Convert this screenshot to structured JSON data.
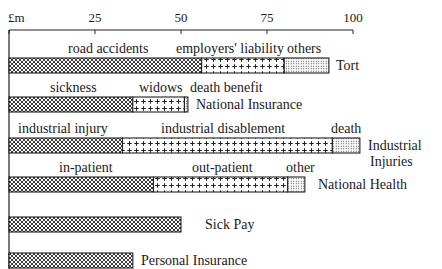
{
  "chart_data": {
    "type": "bar",
    "orientation": "horizontal",
    "stacked": true,
    "title": "",
    "xlabel": "£m",
    "ylabel": "",
    "xlim": [
      0,
      100
    ],
    "xticks": [
      0,
      25,
      50,
      75,
      100
    ],
    "xtick_labels": [
      "£m",
      "25",
      "50",
      "75",
      "100"
    ],
    "grid": false,
    "legend": "inline segment labels above bars",
    "categories": [
      "Tort",
      "National Insurance",
      "Industrial Injuries",
      "National Health",
      "Sick Pay",
      "Personal Insurance"
    ],
    "rows": [
      {
        "category": "Tort",
        "label_lines": [
          "Tort"
        ],
        "segments": [
          {
            "name": "road accidents",
            "value": 56,
            "pattern": "crosshatch"
          },
          {
            "name": "employers' liability",
            "value": 24,
            "pattern": "plus"
          },
          {
            "name": "others",
            "value": 13,
            "pattern": "dots"
          }
        ],
        "total": 93
      },
      {
        "category": "National Insurance",
        "label_lines": [
          "National Insurance"
        ],
        "segments": [
          {
            "name": "sickness",
            "value": 36,
            "pattern": "crosshatch"
          },
          {
            "name": "widows",
            "value": 15,
            "pattern": "plus"
          },
          {
            "name": "death benefit",
            "value": 1,
            "pattern": "dots"
          }
        ],
        "total": 52
      },
      {
        "category": "Industrial Injuries",
        "label_lines": [
          "Industrial",
          "Injuries"
        ],
        "segments": [
          {
            "name": "industrial injury",
            "value": 33,
            "pattern": "crosshatch"
          },
          {
            "name": "industrial disablement",
            "value": 61,
            "pattern": "plus"
          },
          {
            "name": "death",
            "value": 8,
            "pattern": "dots"
          }
        ],
        "total": 102
      },
      {
        "category": "National Health",
        "label_lines": [
          "National Health"
        ],
        "segments": [
          {
            "name": "in-patient",
            "value": 42,
            "pattern": "crosshatch"
          },
          {
            "name": "out-patient",
            "value": 39,
            "pattern": "plus"
          },
          {
            "name": "other",
            "value": 5,
            "pattern": "dots"
          }
        ],
        "total": 86
      },
      {
        "category": "Sick Pay",
        "label_lines": [
          "Sick Pay"
        ],
        "segments": [
          {
            "name": "",
            "value": 50,
            "pattern": "crosshatch"
          }
        ],
        "total": 50
      },
      {
        "category": "Personal Insurance",
        "label_lines": [
          "Personal Insurance"
        ],
        "segments": [
          {
            "name": "",
            "value": 36,
            "pattern": "crosshatch"
          }
        ],
        "total": 36
      }
    ]
  },
  "layout": {
    "x0": 9,
    "x100": 353,
    "axis_y": 30,
    "bar_tops": [
      58,
      97,
      138,
      177,
      217,
      253
    ],
    "bar_height": 15,
    "segment_label_offsets": [
      [
        {
          "x": 68
        },
        {
          "x": 176
        },
        {
          "x": 287
        }
      ],
      [
        {
          "x": 50
        },
        {
          "x": 139
        },
        {
          "x": 190
        }
      ],
      [
        {
          "x": 18
        },
        {
          "x": 161
        },
        {
          "x": 331
        }
      ],
      [
        {
          "x": 59
        },
        {
          "x": 192
        },
        {
          "x": 286
        }
      ],
      [],
      []
    ],
    "category_label_x": [
      336,
      196,
      368,
      318,
      205,
      141
    ]
  }
}
